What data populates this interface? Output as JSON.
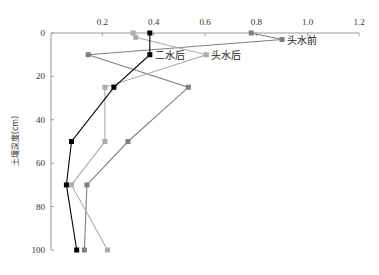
{
  "chart_data": {
    "type": "line",
    "title": "",
    "xlabel": "",
    "ylabel": "土壤深度(cm)",
    "xlim": [
      0,
      1.2
    ],
    "ylim": [
      0,
      100
    ],
    "y_inverted": true,
    "x_axis_position": "top",
    "grid": false,
    "legend": "inline labels near series",
    "x_ticks": [
      "0.2",
      "0.4",
      "0.6",
      "0.8",
      "1.0",
      "1.2"
    ],
    "y_ticks": [
      "0",
      "20",
      "40",
      "60",
      "80",
      "100"
    ],
    "series": [
      {
        "name": "头水前",
        "color": "#7f7f7f",
        "marker": "square",
        "points": [
          {
            "depth": 0,
            "value": 0.78
          },
          {
            "depth": 3,
            "value": 0.9
          },
          {
            "depth": 10,
            "value": 0.145
          },
          {
            "depth": 25,
            "value": 0.535
          },
          {
            "depth": 50,
            "value": 0.3
          },
          {
            "depth": 70,
            "value": 0.14
          },
          {
            "depth": 100,
            "value": 0.13
          }
        ],
        "label_anchor": {
          "depth": 3,
          "value": 0.9
        }
      },
      {
        "name": "头水后",
        "color": "#ababab",
        "marker": "square",
        "points": [
          {
            "depth": 0,
            "value": 0.32
          },
          {
            "depth": 2,
            "value": 0.33
          },
          {
            "depth": 10,
            "value": 0.605
          },
          {
            "depth": 25,
            "value": 0.21
          },
          {
            "depth": 50,
            "value": 0.21
          },
          {
            "depth": 70,
            "value": 0.08
          },
          {
            "depth": 100,
            "value": 0.22
          }
        ],
        "label_anchor": {
          "depth": 10,
          "value": 0.605
        }
      },
      {
        "name": "二水后",
        "color": "#000000",
        "marker": "square",
        "points": [
          {
            "depth": 0,
            "value": 0.385
          },
          {
            "depth": 10,
            "value": 0.385
          },
          {
            "depth": 25,
            "value": 0.245
          },
          {
            "depth": 50,
            "value": 0.08
          },
          {
            "depth": 70,
            "value": 0.06
          },
          {
            "depth": 100,
            "value": 0.1
          }
        ],
        "label_anchor": {
          "depth": 10,
          "value": 0.385
        }
      }
    ]
  }
}
